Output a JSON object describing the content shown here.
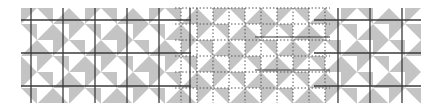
{
  "figure": {
    "colors": {
      "triangle": "#c4c4c4",
      "background": "#ffffff",
      "line": "#3a3a3a",
      "dotted": "#555555"
    },
    "grid": {
      "x0": 21,
      "y0": 8,
      "cell": 16,
      "cols": 25,
      "rows": 6
    },
    "solid_v": [
      31,
      63,
      95,
      127,
      159,
      190,
      338,
      370,
      402
    ],
    "solid_h": [
      20,
      53,
      86
    ],
    "dotted_region": {
      "x_start": 175,
      "x_end": 330
    }
  }
}
